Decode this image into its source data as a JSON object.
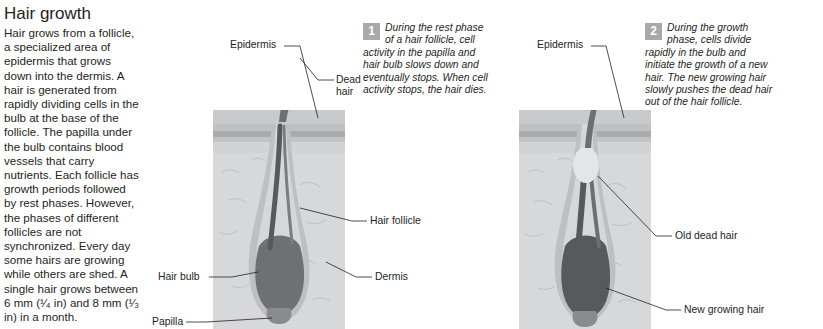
{
  "article": {
    "title": "Hair growth",
    "body": "Hair grows from a follicle, a specialized area of epidermis that grows down into the dermis. A hair is generated from rapidly dividing cells in the bulb at the base of the follicle. The papilla under the bulb contains blood vessels that carry nutrients. Each follicle has growth periods followed by rest phases. However, the phases of different follicles are not synchronized. Every day some hairs are growing while others are shed. A single hair grows between 6 mm (¹⁄₄ in) and 8 mm (¹⁄₃ in) in a month."
  },
  "notes": [
    {
      "number": "1",
      "text": "During the rest phase of a hair follicle, cell activity in the papilla and hair bulb slows down and eventually stops. When cell activity stops, the hair dies."
    },
    {
      "number": "2",
      "text": "During the growth phase, cells divide rapidly in the bulb and initiate the growth of a new hair. The new growing hair slowly pushes the dead hair out of the hair follicle."
    }
  ],
  "figure_left": {
    "labels": {
      "epidermis": "Epidermis",
      "dead_hair": "Dead hair",
      "hair_follicle": "Hair follicle",
      "hair_bulb": "Hair bulb",
      "dermis": "Dermis",
      "papilla": "Papilla"
    }
  },
  "figure_right": {
    "labels": {
      "epidermis": "Epidermis",
      "old_dead_hair": "Old dead hair",
      "new_growing_hair": "New growing hair"
    }
  },
  "colors": {
    "note_badge": "#a7a9ac",
    "skin_light": "#d9dadb",
    "skin_mid": "#bcbdc0",
    "hair_dark": "#6d6e71",
    "follicle_wall": "#a7a9ac",
    "bulb_dark": "#58595b",
    "text": "#231f20"
  }
}
